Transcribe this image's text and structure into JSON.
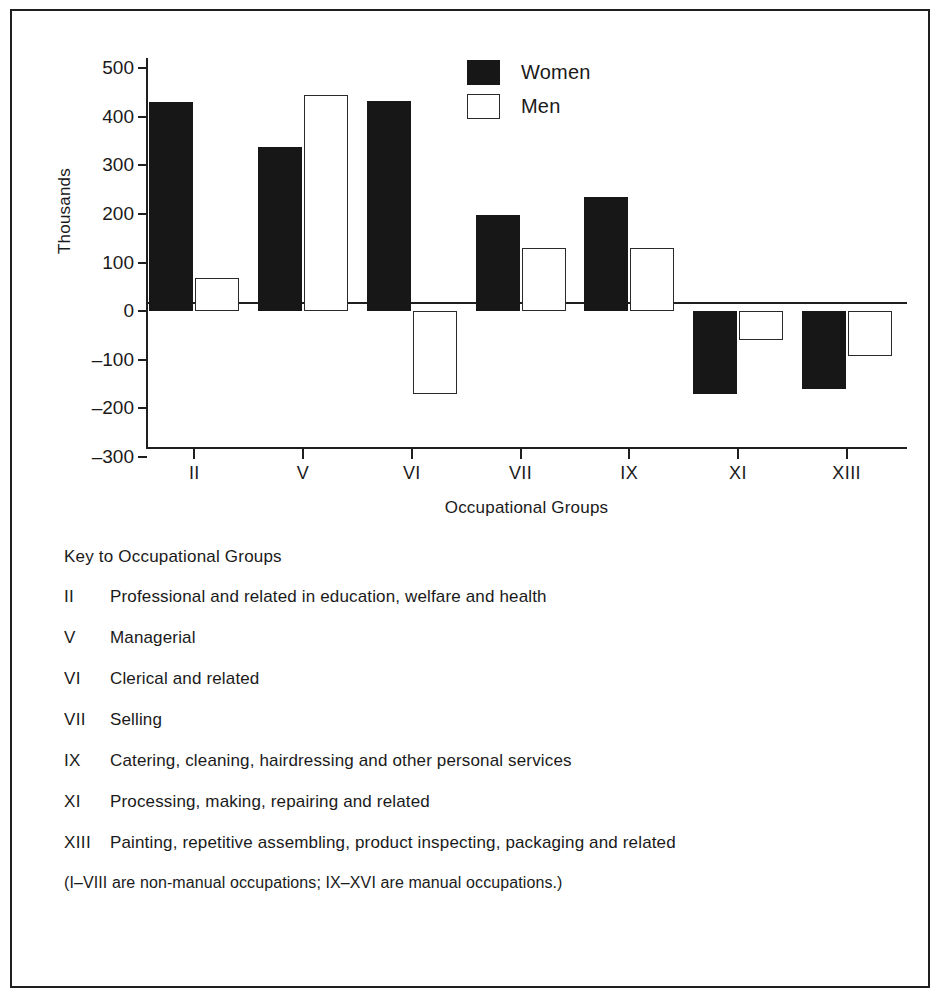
{
  "chart_data": {
    "type": "bar",
    "title": "",
    "xlabel": "Occupational Groups",
    "ylabel": "Thousands",
    "categories": [
      "II",
      "V",
      "VI",
      "VII",
      "IX",
      "XI",
      "XIII"
    ],
    "series": [
      {
        "name": "Women",
        "values": [
          430,
          338,
          432,
          198,
          235,
          -170,
          -160
        ],
        "color": "#171717"
      },
      {
        "name": "Men",
        "values": [
          68,
          445,
          -170,
          130,
          130,
          -60,
          -92
        ],
        "color": "#ffffff"
      }
    ],
    "ylim": [
      -300,
      500
    ],
    "yticks": [
      500,
      400,
      300,
      200,
      100,
      0,
      -100,
      -200,
      -300
    ],
    "ytick_labels": [
      "500",
      "400",
      "300",
      "200",
      "100",
      "0",
      "–100",
      "–200",
      "–300"
    ],
    "grid": false,
    "legend_position": "top-center"
  },
  "legend": {
    "items": [
      {
        "label": "Women",
        "swatch": "filled-black-square"
      },
      {
        "label": "Men",
        "swatch": "open-white-square"
      }
    ]
  },
  "key": {
    "title": "Key to Occupational Groups",
    "rows": [
      {
        "code": "II",
        "description": "Professional and related in education, welfare and health"
      },
      {
        "code": "V",
        "description": "Managerial"
      },
      {
        "code": "VI",
        "description": "Clerical and related"
      },
      {
        "code": "VII",
        "description": "Selling"
      },
      {
        "code": "IX",
        "description": "Catering, cleaning, hairdressing and other personal services"
      },
      {
        "code": "XI",
        "description": "Processing, making, repairing and related"
      },
      {
        "code": "XIII",
        "description": "Painting, repetitive assembling, product inspecting, packaging and related"
      }
    ],
    "note": "(I–VIII are non-manual occupations; IX–XVI are manual occupations.)"
  }
}
